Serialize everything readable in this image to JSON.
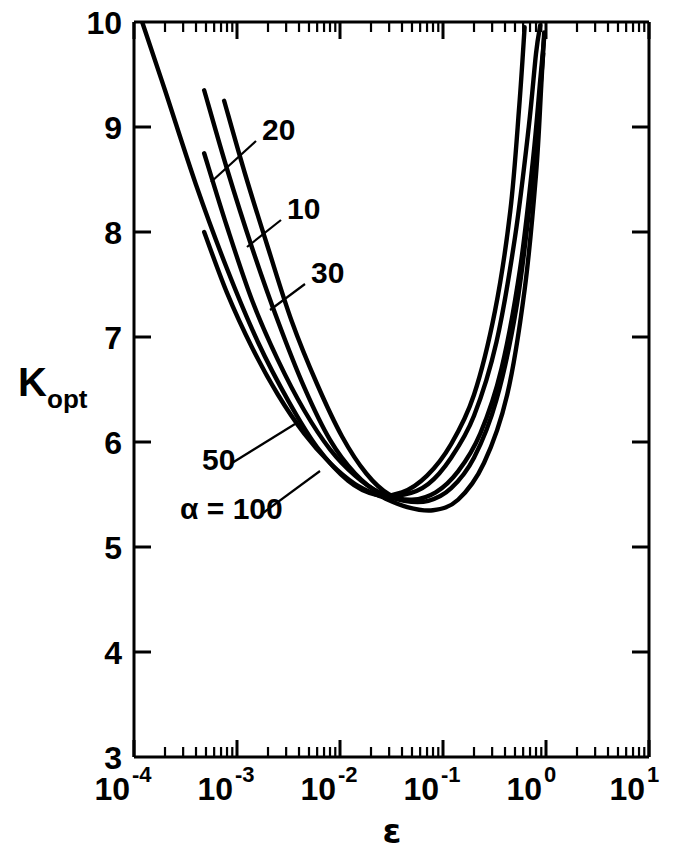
{
  "chart_data": {
    "type": "line",
    "title": "",
    "xlabel": "ε",
    "ylabel": "K_opt",
    "ylabel_base": "K",
    "ylabel_sub": "opt",
    "xscale": "log",
    "yscale": "linear",
    "xlim": [
      0.0001,
      10
    ],
    "ylim": [
      3,
      10
    ],
    "grid": false,
    "legend": "inline curve labels with leader lines",
    "xtick_labels": [
      "10−4",
      "10−3",
      "10−2",
      "10−1",
      "10⁰",
      "10¹"
    ],
    "xtick_mantissas": [
      "10",
      "10",
      "10",
      "10",
      "10",
      "10"
    ],
    "xtick_exponents": [
      "-4",
      "-3",
      "-2",
      "-1",
      "0",
      "1"
    ],
    "xtick_values": [
      0.0001,
      0.001,
      0.01,
      0.1,
      1,
      10
    ],
    "ytick_labels": [
      "3",
      "4",
      "5",
      "6",
      "7",
      "8",
      "9",
      "10"
    ],
    "ytick_values": [
      3,
      4,
      5,
      6,
      7,
      8,
      9,
      10
    ],
    "annotation_prefix": "α =",
    "series": [
      {
        "name": "10",
        "label": "10",
        "alpha": 10,
        "x": [
          0.00012,
          0.0002,
          0.0004,
          0.0008,
          0.0016,
          0.0032,
          0.006,
          0.012,
          0.022,
          0.04,
          0.07,
          0.12,
          0.2,
          0.32,
          0.45,
          0.55,
          0.62
        ],
        "y": [
          10.0,
          9.35,
          8.45,
          7.65,
          6.95,
          6.38,
          5.95,
          5.63,
          5.5,
          5.52,
          5.68,
          5.98,
          6.45,
          7.25,
          8.2,
          9.2,
          9.95
        ]
      },
      {
        "name": "20",
        "label": "20",
        "alpha": 20,
        "x": [
          0.00048,
          0.0008,
          0.0014,
          0.0025,
          0.0045,
          0.008,
          0.014,
          0.024,
          0.042,
          0.072,
          0.12,
          0.2,
          0.33,
          0.5,
          0.68,
          0.8,
          0.88
        ],
        "y": [
          9.35,
          8.6,
          7.85,
          7.15,
          6.52,
          6.02,
          5.7,
          5.52,
          5.5,
          5.6,
          5.85,
          6.25,
          6.95,
          7.95,
          9.0,
          9.7,
          9.97
        ]
      },
      {
        "name": "30",
        "label": "30",
        "alpha": 30,
        "x": [
          0.00075,
          0.0012,
          0.002,
          0.0034,
          0.006,
          0.0105,
          0.018,
          0.03,
          0.05,
          0.085,
          0.14,
          0.23,
          0.37,
          0.56,
          0.75,
          0.88,
          0.96
        ],
        "y": [
          9.25,
          8.55,
          7.85,
          7.15,
          6.55,
          6.05,
          5.7,
          5.5,
          5.45,
          5.52,
          5.72,
          6.08,
          6.7,
          7.65,
          8.7,
          9.45,
          9.85
        ]
      },
      {
        "name": "50",
        "label": "50",
        "alpha": 50,
        "x": [
          0.00048,
          0.0008,
          0.0014,
          0.0025,
          0.0045,
          0.008,
          0.014,
          0.024,
          0.042,
          0.072,
          0.12,
          0.2,
          0.33,
          0.52,
          0.72,
          0.86,
          0.94
        ],
        "y": [
          8.75,
          8.05,
          7.35,
          6.78,
          6.3,
          5.93,
          5.68,
          5.52,
          5.44,
          5.44,
          5.56,
          5.85,
          6.4,
          7.3,
          8.4,
          9.25,
          9.7
        ]
      },
      {
        "name": "100",
        "label": "α = 100",
        "alpha": 100,
        "x": [
          0.00048,
          0.0008,
          0.0014,
          0.0025,
          0.0045,
          0.008,
          0.014,
          0.025,
          0.045,
          0.08,
          0.14,
          0.25,
          0.42,
          0.62,
          0.8,
          0.9,
          0.96
        ],
        "y": [
          8.0,
          7.42,
          6.9,
          6.45,
          6.08,
          5.8,
          5.6,
          5.48,
          5.38,
          5.35,
          5.45,
          5.8,
          6.45,
          7.45,
          8.55,
          9.4,
          9.9
        ]
      }
    ],
    "curve_labels": [
      {
        "text": "20",
        "x_px": 262,
        "y_px": 140
      },
      {
        "text": "10",
        "x_px": 287,
        "y_px": 219
      },
      {
        "text": "30",
        "x_px": 311,
        "y_px": 283
      },
      {
        "text": "50",
        "x_px": 202,
        "y_px": 470
      },
      {
        "text": "α = 100",
        "x_px": 180,
        "y_px": 519
      }
    ]
  },
  "axes": {
    "line_color": "#000000",
    "curve_color": "#000000"
  }
}
